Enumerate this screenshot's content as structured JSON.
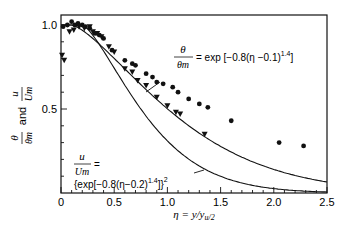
{
  "chart_data": {
    "type": "scatter",
    "title": "",
    "xlabel": "η = y/y_{u/2}",
    "ylabel": "θ/θm and u/Um",
    "xlim": [
      0,
      2.5
    ],
    "ylim": [
      0,
      1.06
    ],
    "grid": false,
    "x_ticks": [
      "0",
      "0.5",
      "1.0",
      "1.5",
      "2.0",
      "2.5"
    ],
    "y_ticks": [
      "0.5",
      "1.0"
    ],
    "series": [
      {
        "name": "θ/θm (temperature)",
        "marker": "circle",
        "points": [
          [
            0.02,
            0.99
          ],
          [
            0.06,
            1.0
          ],
          [
            0.1,
            1.02
          ],
          [
            0.13,
            1.0
          ],
          [
            0.16,
            1.01
          ],
          [
            0.2,
            1.0
          ],
          [
            0.23,
            0.99
          ],
          [
            0.27,
            0.98
          ],
          [
            0.32,
            0.95
          ],
          [
            0.36,
            0.94
          ],
          [
            0.4,
            0.92
          ],
          [
            0.48,
            0.85
          ],
          [
            0.6,
            0.79
          ],
          [
            0.67,
            0.77
          ],
          [
            0.7,
            0.76
          ],
          [
            0.8,
            0.71
          ],
          [
            0.86,
            0.69
          ],
          [
            0.9,
            0.66
          ],
          [
            0.96,
            0.65
          ],
          [
            1.05,
            0.63
          ],
          [
            1.1,
            0.6
          ],
          [
            1.2,
            0.56
          ],
          [
            1.3,
            0.53
          ],
          [
            1.38,
            0.51
          ],
          [
            1.6,
            0.43
          ],
          [
            2.05,
            0.3
          ],
          [
            2.28,
            0.28
          ]
        ]
      },
      {
        "name": "u/Um (velocity)",
        "marker": "triangle-down",
        "points": [
          [
            0.01,
            0.82
          ],
          [
            0.03,
            0.79
          ],
          [
            0.08,
            0.96
          ],
          [
            0.12,
            0.97
          ],
          [
            0.17,
            0.99
          ],
          [
            0.22,
            0.98
          ],
          [
            0.27,
            0.99
          ],
          [
            0.3,
            0.96
          ],
          [
            0.34,
            0.95
          ],
          [
            0.38,
            0.93
          ],
          [
            0.45,
            0.87
          ],
          [
            0.5,
            0.84
          ],
          [
            0.6,
            0.74
          ],
          [
            0.67,
            0.72
          ],
          [
            0.72,
            0.67
          ],
          [
            0.8,
            0.64
          ],
          [
            0.9,
            0.57
          ],
          [
            1.0,
            0.52
          ],
          [
            1.08,
            0.48
          ],
          [
            1.12,
            0.47
          ],
          [
            1.35,
            0.35
          ]
        ]
      }
    ],
    "curves": [
      {
        "name": "θ/θm = exp[−0.8(η−0.1)^1.4]",
        "a": 0.8,
        "shift": 0.1,
        "power": 1.4,
        "square": false
      },
      {
        "name": "u/Um = {exp[−0.8(η−0.2)^1.4]}^2",
        "a": 0.8,
        "shift": 0.2,
        "power": 1.4,
        "square": true
      }
    ],
    "annotations": {
      "theta_lhs_num": "θ",
      "theta_lhs_den": "θm",
      "theta_rhs": "= exp [−0.8(η −0.1)",
      "theta_exp": "1.4",
      "theta_close": "]",
      "u_lhs_num": "u",
      "u_lhs_den": "Um",
      "u_eq": "=",
      "u_rhs": "{exp[−0.8(η−0.2)",
      "u_exp": "1.4",
      "u_close": "]}",
      "u_sq": "2"
    },
    "ylabel_parts": {
      "theta": "θ",
      "theta_m": "θm",
      "and": "and",
      "u": "u",
      "u_m": "Um"
    }
  }
}
